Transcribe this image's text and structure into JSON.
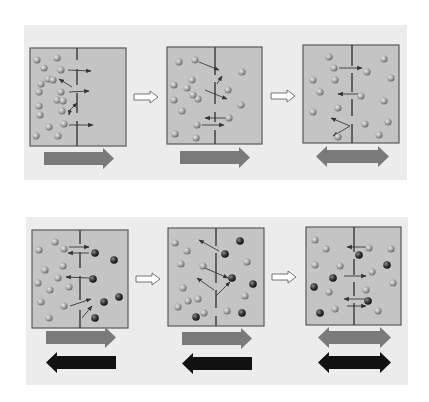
{
  "colors": {
    "page_bg": "#ffffff",
    "band_bg": "#ececec",
    "panel_fill": "#c4c4c4",
    "panel_stroke": "#5a5a5a",
    "membrane": "#4a4a4a",
    "light_particle": "#a9a9a9",
    "dark_particle": "#3e3e3e",
    "motion_arrow": "#3a3a3a",
    "net_arrow_gray": "#7a7a7a",
    "net_arrow_black": "#111111",
    "step_arrow": "#ffffff"
  },
  "rows": [
    {
      "name": "single-solute-diffusion",
      "band": {
        "x": 24,
        "y": 25,
        "w": 383,
        "h": 155
      },
      "panels": [
        {
          "x": 30,
          "y": 48,
          "w": 96,
          "h": 98,
          "mx": 77,
          "gaps": [
            [
              60,
              69
            ],
            [
              85,
              93
            ],
            [
              113,
              121
            ]
          ],
          "light": [
            [
              37,
              60
            ],
            [
              44,
              68
            ],
            [
              48,
              79
            ],
            [
              41,
              84
            ],
            [
              39,
              92
            ],
            [
              39,
              106
            ],
            [
              40,
              115
            ],
            [
              57,
              58
            ],
            [
              53,
              80
            ],
            [
              61,
              70
            ],
            [
              61,
              92
            ],
            [
              57,
              100
            ],
            [
              63,
              101
            ],
            [
              62,
              111
            ],
            [
              49,
              127
            ],
            [
              58,
              136
            ],
            [
              36,
              136
            ],
            [
              64,
              124
            ]
          ],
          "dark": [],
          "arrows": [
            [
              68,
              70,
              91,
              71
            ],
            [
              72,
              87,
              59,
              79
            ],
            [
              69,
              92,
              89,
              91
            ],
            [
              70,
              110,
              77,
              103
            ],
            [
              70,
              110,
              69,
              115
            ],
            [
              69,
              125,
              93,
              125
            ]
          ],
          "net": {
            "type": "right",
            "x": 44,
            "y": 152,
            "w": 70,
            "h": 13,
            "color": "gray"
          }
        },
        {
          "x": 167,
          "y": 47,
          "w": 95,
          "h": 97,
          "mx": 215,
          "gaps": [
            [
              75,
              82
            ],
            [
              104,
              112
            ],
            [
              122,
              130
            ]
          ],
          "light": [
            [
              179,
              62
            ],
            [
              195,
              60
            ],
            [
              192,
              80
            ],
            [
              174,
              85
            ],
            [
              187,
              88
            ],
            [
              174,
              100
            ],
            [
              198,
              99
            ],
            [
              182,
              111
            ],
            [
              193,
              95
            ],
            [
              175,
              134
            ],
            [
              196,
              138
            ],
            [
              242,
              72
            ],
            [
              228,
              90
            ],
            [
              241,
              105
            ],
            [
              229,
              118
            ],
            [
              197,
              125
            ]
          ],
          "dark": [],
          "arrows": [
            [
              199,
              62,
              219,
              70
            ],
            [
              217,
              84,
              222,
              76
            ],
            [
              205,
              90,
              227,
              99
            ],
            [
              228,
              118,
              205,
              118
            ],
            [
              202,
              125,
              224,
              125
            ]
          ],
          "net": {
            "type": "right",
            "x": 180,
            "y": 151,
            "w": 70,
            "h": 13,
            "color": "gray"
          }
        },
        {
          "x": 303,
          "y": 45,
          "w": 96,
          "h": 98,
          "mx": 352,
          "gaps": [
            [
              66,
              73
            ],
            [
              92,
              99
            ],
            [
              116,
              124
            ]
          ],
          "light": [
            [
              329,
              57
            ],
            [
              334,
              68
            ],
            [
              313,
              80
            ],
            [
              320,
              92
            ],
            [
              335,
              80
            ],
            [
              338,
              108
            ],
            [
              313,
              112
            ],
            [
              338,
              137
            ],
            [
              367,
              72
            ],
            [
              361,
              96
            ],
            [
              365,
              124
            ],
            [
              384,
              59
            ],
            [
              391,
              78
            ],
            [
              384,
              101
            ],
            [
              388,
              122
            ],
            [
              379,
              135
            ]
          ],
          "dark": [],
          "arrows": [
            [
              339,
              68,
              362,
              68
            ],
            [
              362,
              94,
              338,
              94
            ],
            [
              350,
              126,
              331,
              118
            ],
            [
              350,
              126,
              333,
              136
            ]
          ],
          "net": {
            "type": "double",
            "x": 316,
            "y": 150,
            "w": 73,
            "h": 13,
            "color": "gray"
          }
        }
      ]
    },
    {
      "name": "two-solute-diffusion",
      "band": {
        "x": 26,
        "y": 217,
        "w": 382,
        "h": 168
      },
      "panels": [
        {
          "x": 32,
          "y": 230,
          "w": 96,
          "h": 98,
          "mx": 80,
          "gaps": [
            [
              244,
              252
            ],
            [
              268,
              276
            ],
            [
              300,
              310
            ]
          ],
          "light": [
            [
              39,
              250
            ],
            [
              55,
              242
            ],
            [
              64,
              249
            ],
            [
              45,
              270
            ],
            [
              63,
              266
            ],
            [
              38,
              283
            ],
            [
              58,
              278
            ],
            [
              69,
              287
            ],
            [
              50,
              290
            ],
            [
              41,
              302
            ],
            [
              64,
              306
            ],
            [
              49,
              318
            ]
          ],
          "dark": [
            [
              95,
              253
            ],
            [
              114,
              260
            ],
            [
              93,
              279
            ],
            [
              104,
              302
            ],
            [
              119,
              297
            ],
            [
              95,
              318
            ]
          ],
          "arrows": [
            [
              69,
              247,
              89,
              247
            ],
            [
              89,
              253,
              68,
              253
            ],
            [
              89,
              278,
              66,
              277
            ],
            [
              70,
              306,
              91,
              299
            ],
            [
              82,
              318,
              92,
              306
            ]
          ],
          "net": [
            {
              "type": "right",
              "x": 46,
              "y": 331,
              "w": 70,
              "h": 13,
              "color": "gray"
            },
            {
              "type": "left",
              "x": 46,
              "y": 356,
              "w": 70,
              "h": 13,
              "color": "black"
            }
          ]
        },
        {
          "x": 168,
          "y": 228,
          "w": 96,
          "h": 98,
          "mx": 216,
          "gaps": [
            [
              246,
              253
            ],
            [
              283,
              290
            ],
            [
              308,
              316
            ]
          ],
          "light": [
            [
              175,
              243
            ],
            [
              187,
              251
            ],
            [
              181,
              264
            ],
            [
              203,
              266
            ],
            [
              183,
              288
            ],
            [
              198,
              299
            ],
            [
              188,
              301
            ],
            [
              178,
              307
            ],
            [
              204,
              313
            ],
            [
              247,
              262
            ],
            [
              245,
              296
            ],
            [
              227,
              311
            ]
          ],
          "dark": [
            [
              240,
              241
            ],
            [
              225,
              254
            ],
            [
              232,
              278
            ],
            [
              253,
              284
            ],
            [
              196,
              317
            ],
            [
              242,
              313
            ]
          ],
          "arrows": [
            [
              219,
              251,
              199,
              240
            ],
            [
              205,
              268,
              228,
              278
            ],
            [
              214,
              290,
              197,
              278
            ],
            [
              216,
              296,
              230,
              282
            ]
          ],
          "net": [
            {
              "type": "right",
              "x": 182,
              "y": 332,
              "w": 70,
              "h": 13,
              "color": "gray"
            },
            {
              "type": "left",
              "x": 182,
              "y": 357,
              "w": 70,
              "h": 13,
              "color": "black"
            }
          ]
        },
        {
          "x": 306,
          "y": 227,
          "w": 95,
          "h": 98,
          "mx": 354,
          "gaps": [
            [
              252,
              259
            ],
            [
              275,
              282
            ],
            [
              296,
              303
            ]
          ],
          "light": [
            [
              315,
              240
            ],
            [
              326,
              249
            ],
            [
              315,
              265
            ],
            [
              340,
              266
            ],
            [
              329,
              292
            ],
            [
              335,
              309
            ],
            [
              369,
              248
            ],
            [
              391,
              249
            ],
            [
              372,
              272
            ],
            [
              366,
              290
            ],
            [
              393,
              283
            ],
            [
              378,
              311
            ]
          ],
          "dark": [
            [
              359,
              255
            ],
            [
              387,
              265
            ],
            [
              333,
              278
            ],
            [
              314,
              287
            ],
            [
              320,
              313
            ],
            [
              368,
              301
            ]
          ],
          "arrows": [
            [
              366,
              247,
              347,
              247
            ],
            [
              344,
              276,
              366,
              276
            ],
            [
              365,
              299,
              344,
              299
            ],
            [
              347,
              306,
              366,
              306
            ]
          ],
          "net": [
            {
              "type": "double",
              "x": 318,
              "y": 331,
              "w": 73,
              "h": 13,
              "color": "gray"
            },
            {
              "type": "double",
              "x": 318,
              "y": 356,
              "w": 73,
              "h": 13,
              "color": "black"
            }
          ]
        }
      ],
      "steps": []
    }
  ],
  "step_arrows": [
    {
      "x": 134,
      "y": 97
    },
    {
      "x": 271,
      "y": 96
    },
    {
      "x": 136,
      "y": 279
    },
    {
      "x": 272,
      "y": 277
    }
  ]
}
